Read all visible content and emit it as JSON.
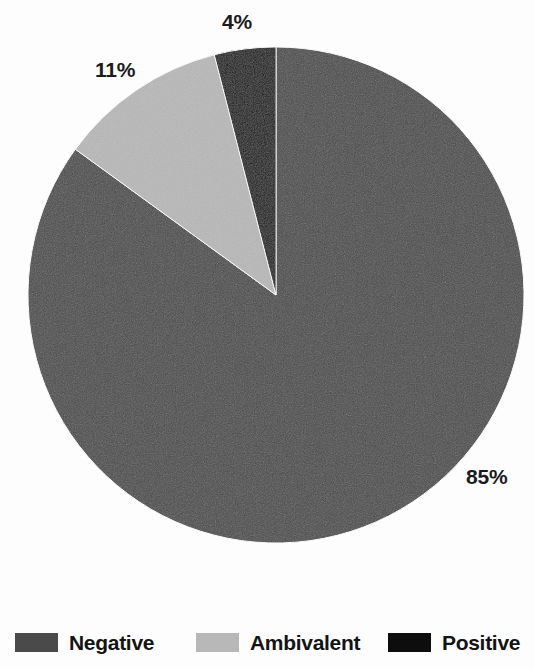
{
  "chart_data": {
    "type": "pie",
    "title": "",
    "subtitle": "",
    "xlabel": "",
    "ylabel": "",
    "grid": false,
    "legend_position": "bottom",
    "start_angle_deg": 0,
    "direction": "clockwise",
    "units": "percent",
    "categories": [
      "Negative",
      "Ambivalent",
      "Positive"
    ],
    "values": [
      85,
      11,
      4
    ],
    "data_labels": [
      "85%",
      "11%",
      "4%"
    ],
    "colors": [
      "#4a4a4a",
      "#b8b8b8",
      "#0d0d0d"
    ],
    "slices": [
      {
        "label": "Negative",
        "value": 85,
        "data_label": "85%",
        "color": "#4a4a4a"
      },
      {
        "label": "Ambivalent",
        "value": 11,
        "data_label": "11%",
        "color": "#b8b8b8"
      },
      {
        "label": "Positive",
        "value": 4,
        "data_label": "4%",
        "color": "#0d0d0d"
      }
    ]
  },
  "labels": {
    "negative_pct": "85%",
    "ambivalent_pct": "11%",
    "positive_pct": "4%"
  },
  "legend": {
    "items": [
      {
        "label": "Negative",
        "color": "#4a4a4a"
      },
      {
        "label": "Ambivalent",
        "color": "#b8b8b8"
      },
      {
        "label": "Positive",
        "color": "#0d0d0d"
      }
    ]
  },
  "colors": {
    "negative": "#4a4a4a",
    "ambivalent": "#b8b8b8",
    "positive": "#0d0d0d",
    "background": "#fdfdfd",
    "text": "#141414"
  }
}
